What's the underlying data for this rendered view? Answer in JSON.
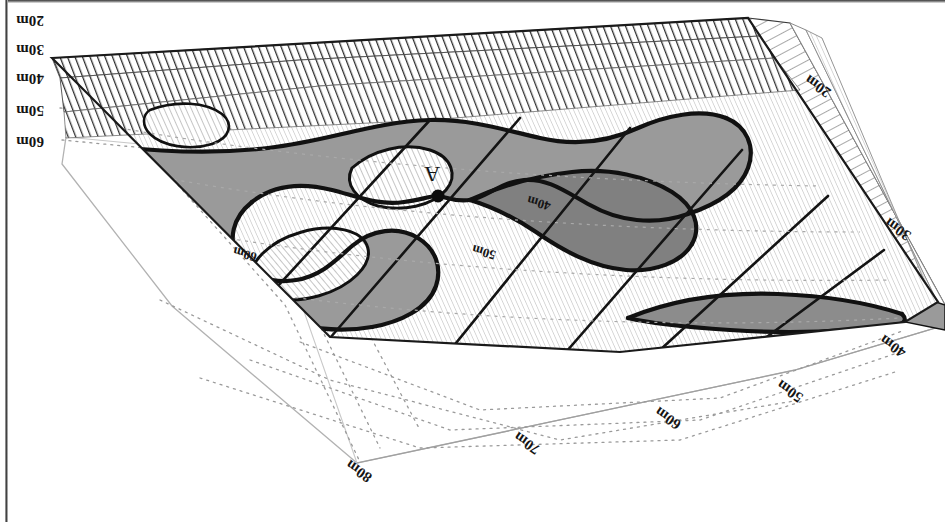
{
  "figure": {
    "type": "3d-block-contour-diagram",
    "orientation": "rotated-180",
    "point_label": "A",
    "colors": {
      "shaded_unit": "#9a9a9a",
      "contour_line": "#111111",
      "base_plane_line": "#b5b5b5",
      "projection_line": "#8d8d8d",
      "hatch_dark": "#2b2b2b",
      "hatch_light": "#b9b9b9",
      "background": "#ffffff"
    }
  },
  "axis_labels_left": [
    {
      "text": "20m",
      "x": 30,
      "y": 20
    },
    {
      "text": "30m",
      "x": 30,
      "y": 49
    },
    {
      "text": "40m",
      "x": 30,
      "y": 78
    },
    {
      "text": "50m",
      "x": 30,
      "y": 110
    },
    {
      "text": "60m",
      "x": 30,
      "y": 141
    }
  ],
  "axis_labels_right": [
    {
      "text": "20m",
      "x": 818,
      "y": 86,
      "rotate": 215
    },
    {
      "text": "30m",
      "x": 898,
      "y": 229,
      "rotate": 215
    }
  ],
  "axis_labels_bottom": [
    {
      "text": "40m",
      "x": 893,
      "y": 346,
      "rotate": 215
    },
    {
      "text": "50m",
      "x": 790,
      "y": 391,
      "rotate": 215
    },
    {
      "text": "60m",
      "x": 668,
      "y": 418,
      "rotate": 215
    },
    {
      "text": "70m",
      "x": 527,
      "y": 443,
      "rotate": 215
    },
    {
      "text": "80m",
      "x": 359,
      "y": 471,
      "rotate": 215
    }
  ],
  "contour_labels": [
    {
      "text": "40m",
      "x": 539,
      "y": 203,
      "rotate": 196
    },
    {
      "text": "50m",
      "x": 484,
      "y": 252,
      "rotate": 196
    },
    {
      "text": "60m",
      "x": 245,
      "y": 254,
      "rotate": 196
    }
  ],
  "point_markers": [
    {
      "label": "A",
      "label_x": 432,
      "label_y": 174,
      "dot_x": 438,
      "dot_y": 196
    }
  ],
  "chart_data": {
    "type": "contour-block-diagram",
    "title": "",
    "xlabel": "",
    "ylabel": "",
    "depth_unit": "m",
    "depth_levels": [
      20,
      30,
      40,
      50,
      60,
      70,
      80
    ],
    "left_axis_ticks": [
      "20m",
      "30m",
      "40m",
      "50m",
      "60m"
    ],
    "right_axis_ticks": [
      "20m",
      "30m"
    ],
    "bottom_axis_ticks": [
      "40m",
      "50m",
      "60m",
      "70m",
      "80m"
    ],
    "labeled_contours": [
      "40m",
      "50m",
      "60m"
    ],
    "annotations": [
      "A"
    ],
    "legend": [],
    "grid": false
  }
}
